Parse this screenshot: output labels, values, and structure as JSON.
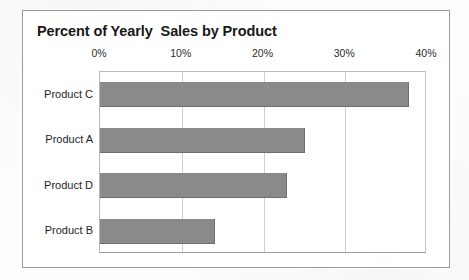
{
  "ghost_text": {
    "upper": "Mountain Everest 8848 m",
    "lower": "PRODUCTS CHART"
  },
  "chart_data": {
    "type": "bar",
    "orientation": "horizontal",
    "title": "Percent of Yearly  Sales by Product",
    "xlabel": "",
    "ylabel": "",
    "categories": [
      "Product C",
      "Product A",
      "Product D",
      "Product B"
    ],
    "values": [
      37.8,
      25.1,
      22.9,
      14.1
    ],
    "value_unit": "%",
    "xlim": [
      0,
      40
    ],
    "tick_labels": [
      "0%",
      "10%",
      "20%",
      "30%",
      "40%"
    ],
    "tick_values": [
      0,
      10,
      20,
      30,
      40
    ],
    "grid": true,
    "grid_axis": "x",
    "axis_position": "top",
    "legend": false,
    "bar_color": "#8a8a8a",
    "plot_background": "#ffffff",
    "frame_border_color": "#9a9a9e"
  }
}
